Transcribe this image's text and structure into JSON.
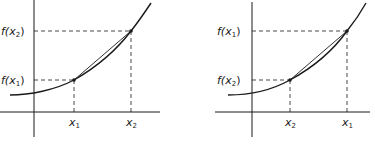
{
  "panels": [
    {
      "id": "left",
      "y_labels": {
        "upper": {
          "f": "f(",
          "x": "x",
          "sub": "2",
          "close": ")"
        },
        "lower": {
          "f": "f(",
          "x": "x",
          "sub": "1",
          "close": ")"
        }
      },
      "x_labels": {
        "left": {
          "x": "x",
          "sub": "1"
        },
        "right": {
          "x": "x",
          "sub": "2"
        }
      }
    },
    {
      "id": "right",
      "y_labels": {
        "upper": {
          "f": "f(",
          "x": "x",
          "sub": "1",
          "close": ")"
        },
        "lower": {
          "f": "f(",
          "x": "x",
          "sub": "2",
          "close": ")"
        }
      },
      "x_labels": {
        "left": {
          "x": "x",
          "sub": "2"
        },
        "right": {
          "x": "x",
          "sub": "1"
        }
      }
    }
  ],
  "colors": {
    "ink": "#1a1a1a",
    "background": "#ffffff"
  }
}
